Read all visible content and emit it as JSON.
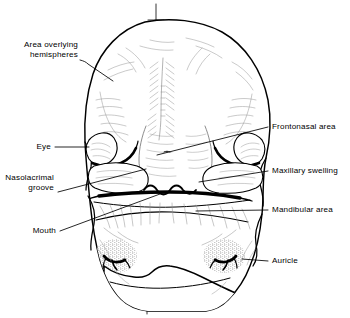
{
  "figure": {
    "type": "anatomical-line-drawing",
    "background_color": "#ffffff",
    "ink_color": "#000000",
    "midline_present": true
  },
  "labels": {
    "area_overlying_hemispheres": "Area overlying\nhemispheres",
    "eye": "Eye",
    "nasolacrimal_groove": "Nasolacrimal\ngroove",
    "mouth": "Mouth",
    "frontonasal_area": "Frontonasal area",
    "maxillary_swelling": "Maxillary swelling",
    "mandibular_area": "Mandibular area",
    "auricle": "Auricle"
  },
  "label_list": [
    {
      "id": "area-overlying-hemispheres",
      "text": "Area overlying\nhemispheres",
      "side": "left",
      "x": 18,
      "y": 40
    },
    {
      "id": "eye",
      "text": "Eye",
      "side": "left",
      "x": 37,
      "y": 143
    },
    {
      "id": "nasolacrimal-groove",
      "text": "Nasolacrimal\ngroove",
      "side": "left",
      "x": 9,
      "y": 174
    },
    {
      "id": "mouth",
      "text": "Mouth",
      "side": "left",
      "x": 29,
      "y": 226
    },
    {
      "id": "frontonasal-area",
      "text": "Frontonasal area",
      "side": "right",
      "x": 271,
      "y": 123
    },
    {
      "id": "maxillary-swelling",
      "text": "Maxillary swelling",
      "side": "right",
      "x": 271,
      "y": 167
    },
    {
      "id": "mandibular-area",
      "text": "Mandibular area",
      "side": "right",
      "x": 271,
      "y": 205
    },
    {
      "id": "auricle",
      "text": "Auricle",
      "side": "right",
      "x": 271,
      "y": 257
    }
  ]
}
